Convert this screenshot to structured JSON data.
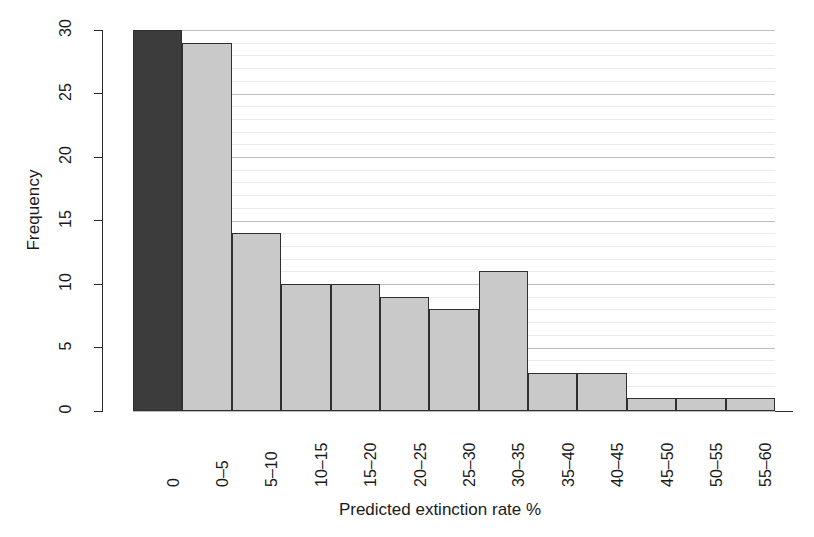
{
  "chart_data": {
    "type": "bar",
    "title": "",
    "subtitle": "",
    "xlabel": "Predicted extinction rate %",
    "ylabel": "Frequency",
    "categories": [
      "0",
      "0–5",
      "5–10",
      "10–15",
      "15–20",
      "20–25",
      "25–30",
      "30–35",
      "35–40",
      "40–45",
      "45–50",
      "50–55",
      "55–60"
    ],
    "values": [
      30,
      29,
      14,
      10,
      10,
      9,
      8,
      11,
      3,
      3,
      1,
      1,
      1
    ],
    "ylim": [
      0,
      30
    ],
    "yticks": [
      0,
      5,
      10,
      15,
      20,
      25,
      30
    ],
    "ytick_labels": [
      "0",
      "5",
      "10",
      "15",
      "20",
      "25",
      "30"
    ],
    "minor_tick_step": 1,
    "grid": "horizontal",
    "legend": "none",
    "bar_colors": [
      "#3c3c3c",
      "#c9c9c9",
      "#c9c9c9",
      "#c9c9c9",
      "#c9c9c9",
      "#c9c9c9",
      "#c9c9c9",
      "#c9c9c9",
      "#c9c9c9",
      "#c9c9c9",
      "#c9c9c9",
      "#c9c9c9",
      "#c9c9c9"
    ],
    "bar_edge_color": "#2f2f2f",
    "highlight_color": "#3c3c3c",
    "default_bar_color": "#c9c9c9",
    "grid_minor_color": "#e9ecef",
    "grid_major_color": "#b9bec4",
    "axis_color": "#2b2b2b",
    "background_color": "#ffffff"
  }
}
